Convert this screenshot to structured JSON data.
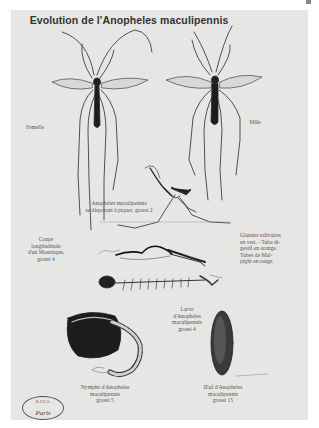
{
  "plate": {
    "title": "Evolution de l'Anopheles maculipennis",
    "labels": {
      "female": "Femelle",
      "male": "Mâle",
      "biting": [
        "Anopheles maculipennis",
        "se disposant à piquer, grossi 2"
      ],
      "section": [
        "Coupe",
        "longitudinale",
        "d'un Moustique,",
        "grossi 4"
      ],
      "glands": [
        "Glandes salivaires",
        "en vert. - Tube di-",
        "gestif en orange.",
        "Tubes de Mal-",
        "pighi en rouge."
      ],
      "larva": [
        "Larve",
        "d'Anopheles",
        "maculipennis",
        "grossi 4"
      ],
      "nymph": [
        "Nymphe d'Anopheles",
        "maculipennis",
        "grossi 5"
      ],
      "egg": [
        "Œuf d'Anopheles",
        "maculipennis",
        "grossi 15"
      ]
    },
    "stamp": {
      "top": "B.I.U.S.",
      "city": "Paris"
    },
    "colors": {
      "paper": "#e6e6e4",
      "ink": "#1a1a1a",
      "caption": "#555555"
    }
  }
}
